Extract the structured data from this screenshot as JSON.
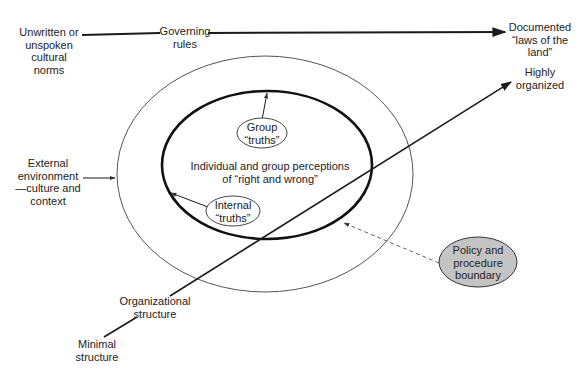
{
  "diagram": {
    "top_axis": {
      "left_label": "Unwritten or\nunspoken\ncultural\nnorms",
      "middle_label": "Governing\nrules",
      "right_label": "Documented\n“laws of the\nland”"
    },
    "diagonal_axis": {
      "start_label": "Minimal\nstructure",
      "middle_label": "Organizational\nstructure",
      "end_label": "Highly\norganized"
    },
    "outer_ellipse": {
      "pointer_label": "External\nenvironment\n—culture and\ncontext"
    },
    "inner_ellipse": {
      "center_label": "Individual and group perceptions\nof “right and wrong”",
      "group_bubble": "Group\n“truths”",
      "internal_bubble": "Internal\n“truths”"
    },
    "policy_bubble": {
      "label": "Policy and\nprocedure\nboundary",
      "fill": "#c4c4c4"
    },
    "colors": {
      "line": "#1a1a1a",
      "outer_ellipse": "#555555",
      "dashed": "#666666"
    }
  }
}
